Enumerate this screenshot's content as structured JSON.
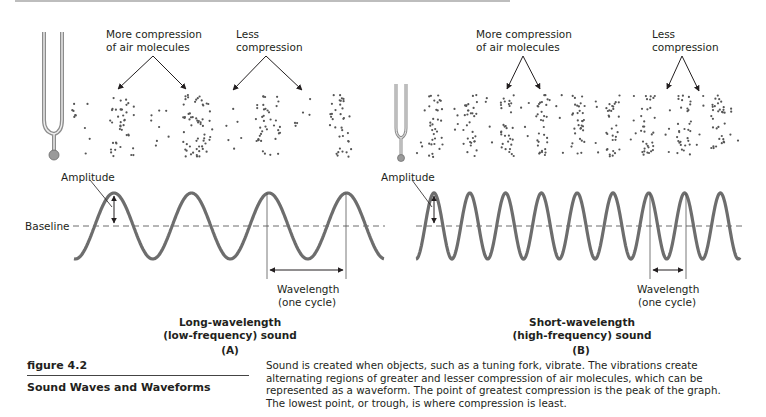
{
  "panel_a": {
    "label_compression_more": [
      "More compression",
      "of air molecules"
    ],
    "label_compression_less": [
      "Less",
      "compression"
    ],
    "amplitude": "Amplitude",
    "baseline": "Baseline",
    "wavelength": [
      "Wavelength",
      "(one cycle)"
    ],
    "title": [
      "Long-wavelength",
      "(low-frequency) sound"
    ],
    "letter": "(A)"
  },
  "panel_b": {
    "label_compression_more": [
      "More compression",
      "of air molecules"
    ],
    "label_compression_less": [
      "Less",
      "compression"
    ],
    "amplitude": "Amplitude",
    "wavelength": [
      "Wavelength",
      "(one cycle)"
    ],
    "title": [
      "Short-wavelength",
      "(high-frequency) sound"
    ],
    "letter": "(B)"
  },
  "figure": {
    "number": "figure 4.2",
    "title": "Sound Waves and Waveforms",
    "caption": "Sound is created when objects, such as a tuning fork, vibrate. The vibrations create alternating regions of greater and lesser compression of air molecules, which can be represented as a waveform. The point of greatest compression is the peak of the graph. The lowest point, or trough, is where compression is least."
  },
  "colors": {
    "wave": "#6d6d6d",
    "ink": "#231f20",
    "dots": "#555555",
    "fork": "#9a9a9a"
  }
}
